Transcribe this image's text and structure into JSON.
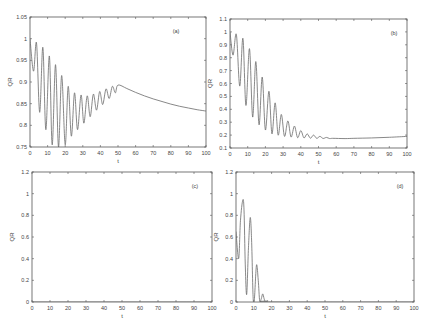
{
  "figure": {
    "background": "#ffffff",
    "line_color": "#6a6a6a",
    "axis_color": "#555555"
  },
  "chart_data": [
    {
      "panel": "(a)",
      "type": "line",
      "title": "",
      "xlabel": "t",
      "ylabel": "QR",
      "xlim": [
        0,
        100
      ],
      "ylim": [
        0.75,
        1.05
      ],
      "xticks": [
        0,
        10,
        20,
        30,
        40,
        50,
        60,
        70,
        80,
        90,
        100
      ],
      "yticks": [
        0.75,
        0.8,
        0.85,
        0.9,
        0.95,
        1,
        1.05
      ],
      "ytick_labels": [
        "0.75",
        "0.8",
        "0.85",
        "0.9",
        "0.95",
        "1",
        "1.05"
      ],
      "grid": false,
      "box": {
        "x": 30,
        "y": 17,
        "w": 176,
        "h": 130
      },
      "label_pos": {
        "x": 176,
        "y": 33
      },
      "x": [
        0,
        2,
        3.7,
        5.5,
        7.3,
        9,
        11,
        12.6,
        14.5,
        16.2,
        18,
        20,
        21.7,
        23.5,
        25.3,
        27,
        29,
        30.6,
        32.5,
        34.2,
        36,
        37.8,
        39.6,
        41.3,
        43.2,
        45,
        46.8,
        48.5,
        50,
        55,
        60,
        65,
        70,
        75,
        80,
        85,
        90,
        95,
        100
      ],
      "y": [
        1.0,
        0.925,
        0.99,
        0.83,
        0.98,
        0.79,
        0.96,
        0.755,
        0.94,
        0.75,
        0.915,
        0.755,
        0.89,
        0.775,
        0.875,
        0.79,
        0.87,
        0.805,
        0.868,
        0.82,
        0.872,
        0.835,
        0.878,
        0.848,
        0.884,
        0.862,
        0.89,
        0.875,
        0.893,
        0.885,
        0.876,
        0.868,
        0.861,
        0.855,
        0.849,
        0.844,
        0.84,
        0.836,
        0.833
      ]
    },
    {
      "panel": "(b)",
      "type": "line",
      "title": "",
      "xlabel": "t",
      "ylabel": "QR",
      "xlim": [
        0,
        100
      ],
      "ylim": [
        0.1,
        1.1
      ],
      "xticks": [
        0,
        10,
        20,
        30,
        40,
        50,
        60,
        70,
        80,
        90,
        100
      ],
      "yticks": [
        0.1,
        0.2,
        0.3,
        0.4,
        0.5,
        0.6,
        0.7,
        0.8,
        0.9,
        1,
        1.1
      ],
      "ytick_labels": [
        "0.1",
        "0.2",
        "0.3",
        "0.4",
        "0.5",
        "0.6",
        "0.7",
        "0.8",
        "0.9",
        "1",
        "1.1"
      ],
      "grid": false,
      "box": {
        "x": 230,
        "y": 19,
        "w": 177,
        "h": 129
      },
      "label_pos": {
        "x": 394,
        "y": 35
      },
      "x": [
        0,
        1.7,
        3.6,
        5.5,
        7.3,
        9,
        11,
        12.8,
        14.6,
        16.4,
        18.2,
        20,
        22,
        23.7,
        25.5,
        27.2,
        29,
        30.8,
        32.7,
        34.5,
        36.4,
        38.2,
        40,
        41.8,
        43.6,
        45.4,
        47.2,
        49,
        50.8,
        52.6,
        54.5,
        56.3,
        58,
        65,
        70,
        80,
        90,
        100
      ],
      "y": [
        1.0,
        0.82,
        0.98,
        0.58,
        0.95,
        0.43,
        0.87,
        0.34,
        0.77,
        0.28,
        0.65,
        0.24,
        0.54,
        0.21,
        0.45,
        0.2,
        0.36,
        0.19,
        0.31,
        0.185,
        0.27,
        0.18,
        0.235,
        0.178,
        0.21,
        0.176,
        0.2,
        0.175,
        0.19,
        0.174,
        0.182,
        0.173,
        0.175,
        0.173,
        0.175,
        0.178,
        0.183,
        0.19
      ]
    },
    {
      "panel": "(c)",
      "type": "line",
      "title": "",
      "xlabel": "t",
      "ylabel": "QR",
      "xlim": [
        0,
        100
      ],
      "ylim": [
        0,
        1.2
      ],
      "xticks": [
        0,
        10,
        20,
        30,
        40,
        50,
        60,
        70,
        80,
        90,
        100
      ],
      "yticks": [
        0,
        0.2,
        0.4,
        0.6,
        0.8,
        1,
        1.2
      ],
      "ytick_labels": [
        "0",
        "0.2",
        "0.4",
        "0.6",
        "0.8",
        "1",
        "1.2"
      ],
      "grid": false,
      "box": {
        "x": 32,
        "y": 172,
        "w": 180,
        "h": 130
      },
      "label_pos": {
        "x": 195,
        "y": 188
      },
      "x": [
        0,
        100
      ],
      "y": [
        0,
        0
      ]
    },
    {
      "panel": "(d)",
      "type": "line",
      "title": "",
      "xlabel": "t",
      "ylabel": "QR",
      "xlim": [
        0,
        100
      ],
      "ylim": [
        0,
        1.2
      ],
      "xticks": [
        0,
        10,
        20,
        30,
        40,
        50,
        60,
        70,
        80,
        90,
        100
      ],
      "yticks": [
        0,
        0.2,
        0.4,
        0.6,
        0.8,
        1,
        1.2
      ],
      "ytick_labels": [
        "0",
        "0.2",
        "0.4",
        "0.6",
        "0.8",
        "1",
        "1.2"
      ],
      "grid": false,
      "box": {
        "x": 236,
        "y": 172,
        "w": 178,
        "h": 130
      },
      "label_pos": {
        "x": 400,
        "y": 188
      },
      "x": [
        0,
        1.5,
        2.5,
        3.8,
        4.5,
        5.2,
        6,
        7,
        8,
        8.8,
        9.6,
        10.3,
        11.5,
        12.5,
        13.3,
        14.2,
        15,
        15.8,
        16.6,
        18,
        20,
        100
      ],
      "y": [
        0.65,
        0.4,
        0.75,
        0.94,
        0.85,
        0.35,
        0.07,
        0.5,
        0.78,
        0.55,
        0.05,
        0.02,
        0.34,
        0.2,
        0.01,
        0.03,
        0.075,
        0.03,
        0.0,
        0.01,
        0.0,
        0.0
      ]
    }
  ]
}
